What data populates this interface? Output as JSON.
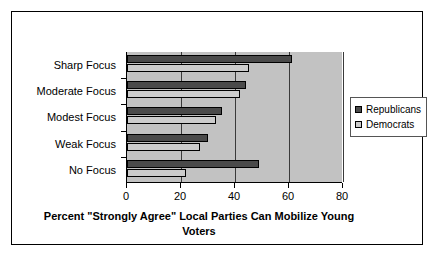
{
  "chart_data": {
    "type": "bar",
    "orientation": "horizontal",
    "title": "",
    "xlabel": "Percent \"Strongly Agree\" Local Parties Can Mobilize Young Voters",
    "ylabel": "",
    "categories": [
      "Sharp Focus",
      "Moderate Focus",
      "Modest Focus",
      "Weak Focus",
      "No Focus"
    ],
    "series": [
      {
        "name": "Republicans",
        "color": "#4a4a4a",
        "values": [
          61,
          44,
          35,
          30,
          49
        ]
      },
      {
        "name": "Democrats",
        "color": "#cccccc",
        "values": [
          45,
          42,
          33,
          27,
          22
        ]
      }
    ],
    "xlim": [
      0,
      80
    ],
    "xticks": [
      0,
      20,
      40,
      60,
      80
    ],
    "xtick_labels": [
      "0",
      "20",
      "40",
      "60",
      "80"
    ],
    "grid": true,
    "grid_axis": "x",
    "legend_position": "right",
    "plot_background": "#c2c2c2",
    "frame_color": "#000000"
  },
  "axis": {
    "title_line1": "Percent \"Strongly Agree\" Local Parties Can Mobilize Young",
    "title_line2": "Voters"
  },
  "legend": {
    "items": [
      {
        "label": "Republicans"
      },
      {
        "label": "Democrats"
      }
    ]
  }
}
